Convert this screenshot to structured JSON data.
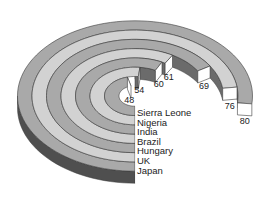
{
  "chart_data": {
    "type": "radial-bar-3d",
    "title": "",
    "categories": [
      "Sierra Leone",
      "Nigeria",
      "India",
      "Brazil",
      "Hungary",
      "UK",
      "Japan"
    ],
    "values": [
      48,
      54,
      60,
      61,
      69,
      76,
      80
    ],
    "value_labels": [
      "48",
      "54",
      "60",
      "61",
      "69",
      "76",
      "80"
    ],
    "xlabel": "",
    "ylabel": "",
    "grid": false,
    "legend": "category labels listed below ring start, innermost first",
    "order": "inner-to-outer",
    "max_value": 80,
    "colors": {
      "ring_dark": "#a9a9a9",
      "ring_light": "#d2d2d2",
      "wall": "#4f4f4f",
      "end_cap": "#ffffff",
      "inner_wall": "#6b6b6b",
      "outline": "#3a3a3a"
    }
  }
}
